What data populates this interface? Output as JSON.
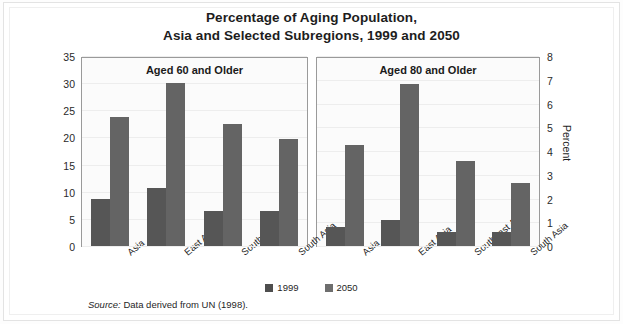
{
  "figure": {
    "title_line1": "Percentage of Aging Population,",
    "title_line2": "Asia and Selected Subregions, 1999 and 2050",
    "source_label": "Source:",
    "source_text": " Data derived from UN (1998)."
  },
  "legend": {
    "position": "bottom-center",
    "entries": [
      {
        "label": "1999",
        "color": "#4e4e4e"
      },
      {
        "label": "2050",
        "color": "#6e6e6e"
      }
    ]
  },
  "axes": {
    "left": {
      "title": "Percent",
      "ticks": [
        "0",
        "5",
        "10",
        "15",
        "20",
        "25",
        "30",
        "35"
      ]
    },
    "right": {
      "title": "Percent",
      "ticks": [
        "0",
        "1",
        "2",
        "3",
        "4",
        "5",
        "6",
        "7",
        "8"
      ]
    }
  },
  "panels": [
    {
      "title": "Aged 60 and Older"
    },
    {
      "title": "Aged 80 and Older"
    }
  ],
  "categories": [
    "Asia",
    "East Asia",
    "Southeast Asia",
    "South Asia"
  ],
  "chart_data": [
    {
      "type": "bar",
      "title": "Aged 60 and Older",
      "categories": [
        "Asia",
        "East Asia",
        "Southeast Asia",
        "South Asia"
      ],
      "series": [
        {
          "name": "1999",
          "values": [
            8.7,
            10.8,
            6.6,
            6.6
          ],
          "color": "#565656"
        },
        {
          "name": "2050",
          "values": [
            24.0,
            30.3,
            22.8,
            20.0
          ],
          "color": "#646464"
        }
      ],
      "xlabel": "",
      "ylabel": "Percent",
      "ylim": [
        0,
        35
      ],
      "ytick_step": 5,
      "grid": true,
      "legend": "bottom-center"
    },
    {
      "type": "bar",
      "title": "Aged 80 and Older",
      "categories": [
        "Asia",
        "East Asia",
        "Southeast Asia",
        "South Asia"
      ],
      "series": [
        {
          "name": "1999",
          "values": [
            0.8,
            1.1,
            0.6,
            0.6
          ],
          "color": "#565656"
        },
        {
          "name": "2050",
          "values": [
            4.3,
            6.9,
            3.6,
            2.7
          ],
          "color": "#646464"
        }
      ],
      "xlabel": "",
      "ylabel": "Percent",
      "ylim": [
        0,
        8
      ],
      "ytick_step": 1,
      "grid": true,
      "legend": "bottom-center"
    }
  ]
}
